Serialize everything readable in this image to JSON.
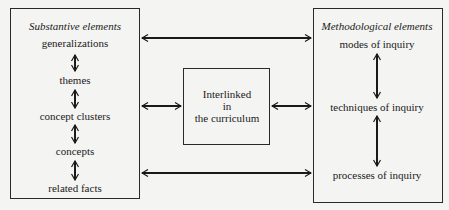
{
  "left_box": {
    "title": "Substantive elements",
    "items": [
      "generalizations",
      "themes",
      "concept clusters",
      "concepts",
      "related facts"
    ]
  },
  "right_box": {
    "title": "Methodological elements",
    "items": [
      "modes of inquiry",
      "techniques of inquiry",
      "processes of inquiry"
    ]
  },
  "center_box": {
    "lines": [
      "Interlinked",
      "in",
      "the curriculum"
    ]
  }
}
